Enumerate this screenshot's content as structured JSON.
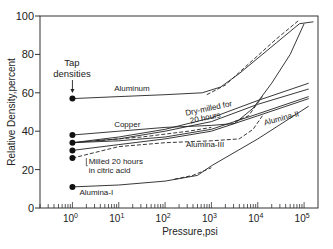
{
  "chart_data": {
    "type": "line",
    "title": "",
    "xlabel": "Pressure,psi",
    "ylabel": "Relative Density,percent",
    "xscale": "log",
    "xlim_log10": [
      -0.7,
      5.3
    ],
    "ylim": [
      0,
      100
    ],
    "x_tick_labels": [
      {
        "exp": 0,
        "base": "10",
        "sup": "0"
      },
      {
        "exp": 1,
        "base": "10",
        "sup": "1"
      },
      {
        "exp": 2,
        "base": "10",
        "sup": "2"
      },
      {
        "exp": 3,
        "base": "10",
        "sup": "3"
      },
      {
        "exp": 4,
        "base": "10",
        "sup": "4"
      },
      {
        "exp": 5,
        "base": "10",
        "sup": "5"
      }
    ],
    "y_ticks": [
      0,
      20,
      40,
      60,
      80,
      100
    ],
    "grid": false,
    "tap_densities": {
      "label_line1": "Tap",
      "label_line2": "densities",
      "x_log10": 0,
      "values": [
        57,
        38,
        34,
        30,
        26,
        11
      ]
    },
    "series": [
      {
        "name": "Aluminum",
        "style": "solid",
        "points": [
          [
            0,
            57
          ],
          [
            1,
            58
          ],
          [
            2,
            59
          ],
          [
            2.8,
            60
          ],
          [
            3.2,
            63
          ],
          [
            3.6,
            70
          ],
          [
            4.4,
            86
          ],
          [
            4.9,
            96
          ],
          [
            5.2,
            97
          ]
        ]
      },
      {
        "name": "Aluminum-compacted",
        "style": "dashed",
        "points": [
          [
            2.9,
            59
          ],
          [
            3.3,
            64
          ],
          [
            3.8,
            75
          ],
          [
            4.4,
            88
          ],
          [
            4.9,
            98
          ]
        ]
      },
      {
        "name": "Copper",
        "style": "solid",
        "points": [
          [
            0,
            38
          ],
          [
            1,
            40
          ],
          [
            2,
            42
          ],
          [
            3,
            43
          ],
          [
            3.5,
            44
          ],
          [
            3.9,
            52
          ],
          [
            4.3,
            65
          ],
          [
            4.7,
            80
          ],
          [
            5.0,
            96
          ]
        ]
      },
      {
        "name": "Copper-compacted",
        "style": "dashed",
        "points": [
          [
            3.5,
            45
          ],
          [
            3.8,
            48
          ],
          [
            4.1,
            58
          ]
        ]
      },
      {
        "name": "Dry-milled for 20 hours",
        "style": "solid",
        "points": [
          [
            0,
            34
          ],
          [
            1,
            37
          ],
          [
            2,
            41
          ],
          [
            3,
            47
          ],
          [
            4,
            56
          ],
          [
            5.1,
            65
          ]
        ]
      },
      {
        "name": "Dry-milled-b",
        "style": "solid",
        "points": [
          [
            0,
            34
          ],
          [
            1,
            36
          ],
          [
            2,
            40
          ],
          [
            3,
            45
          ],
          [
            4,
            54
          ],
          [
            5.1,
            62
          ]
        ]
      },
      {
        "name": "Alumina-III",
        "style": "solid",
        "points": [
          [
            0,
            34
          ],
          [
            1,
            35
          ],
          [
            2,
            37
          ],
          [
            3,
            41
          ],
          [
            4,
            49
          ],
          [
            5.1,
            58
          ]
        ]
      },
      {
        "name": "Alumina-III-compacted",
        "style": "dashed",
        "points": [
          [
            0.5,
            35
          ],
          [
            1.5,
            37
          ],
          [
            2.5,
            40
          ],
          [
            3,
            42
          ]
        ]
      },
      {
        "name": "Alumina-II",
        "style": "solid",
        "points": [
          [
            0,
            30
          ],
          [
            1,
            33
          ],
          [
            2,
            36
          ],
          [
            3,
            40
          ],
          [
            4,
            48
          ],
          [
            5.1,
            57
          ]
        ]
      },
      {
        "name": "Milled 20 hours in citric acid",
        "style": "dashed",
        "points": [
          [
            0,
            26
          ],
          [
            1,
            32
          ],
          [
            2,
            34
          ],
          [
            3,
            35
          ],
          [
            3.6,
            36
          ],
          [
            3.9,
            41
          ],
          [
            4.1,
            48
          ]
        ]
      },
      {
        "name": "Alumina-I",
        "style": "solid",
        "points": [
          [
            0,
            11
          ],
          [
            1,
            12
          ],
          [
            2,
            14
          ],
          [
            2.7,
            17
          ],
          [
            3,
            22
          ],
          [
            4,
            36
          ],
          [
            5.1,
            53
          ]
        ]
      },
      {
        "name": "Alumina-I-compacted",
        "style": "dashed",
        "points": [
          [
            2.2,
            15
          ],
          [
            2.6,
            17
          ],
          [
            3,
            21
          ]
        ]
      }
    ],
    "annotations": [
      {
        "text": "Aluminum",
        "x_log10": 0.9,
        "y": 61
      },
      {
        "text": "Dry-milled for",
        "x_log10": 2.45,
        "y": 48,
        "rotate": -12
      },
      {
        "text": "20 hours",
        "x_log10": 2.55,
        "y": 44,
        "rotate": -12
      },
      {
        "text": "Copper",
        "x_log10": 0.9,
        "y": 42
      },
      {
        "text": "Alumina-III",
        "x_log10": 2.45,
        "y": 32
      },
      {
        "text": "Milled 20 hours",
        "x_log10": 0.35,
        "y": 23
      },
      {
        "text": "in citric acid",
        "x_log10": 0.35,
        "y": 18
      },
      {
        "text": "Alumina-II",
        "x_log10": 4.15,
        "y": 43,
        "rotate": -15
      },
      {
        "text": "Alumina-I",
        "x_log10": 0.15,
        "y": 7
      }
    ]
  }
}
